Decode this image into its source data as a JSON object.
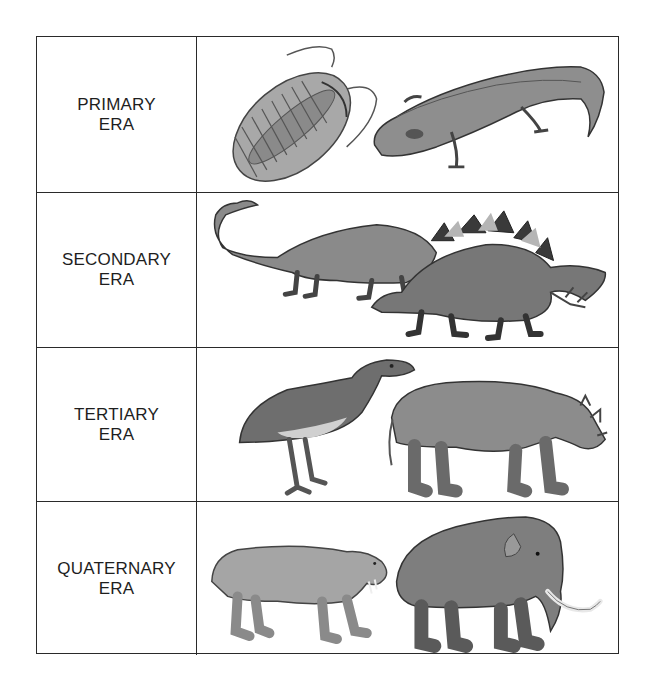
{
  "figure": {
    "type": "geological-eras-table",
    "rows": [
      {
        "era_line1": "PRIMARY",
        "era_line2": "ERA",
        "animals": [
          "trilobite",
          "amphibian"
        ]
      },
      {
        "era_line1": "SECONDARY",
        "era_line2": "ERA",
        "animals": [
          "sauropod-dinosaur",
          "stegosaurus"
        ]
      },
      {
        "era_line1": "TERTIARY",
        "era_line2": "ERA",
        "animals": [
          "diatryma-bird",
          "uintatherium"
        ]
      },
      {
        "era_line1": "QUATERNARY",
        "era_line2": "ERA",
        "animals": [
          "saber-toothed-cat",
          "mammoth"
        ]
      }
    ]
  },
  "colors": {
    "border": "#2a2a2a",
    "text": "#1e1e1e",
    "illustration_dark": "#3a3a3a",
    "illustration_mid": "#7a7a7a",
    "illustration_light": "#b5b5b5",
    "background": "#ffffff"
  }
}
